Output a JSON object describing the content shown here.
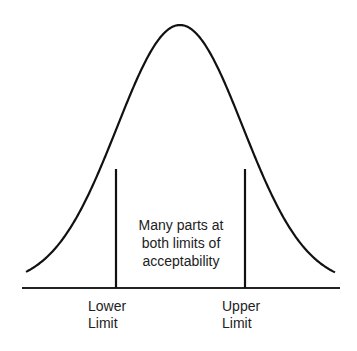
{
  "diagram": {
    "curve": {
      "type": "bell-curve",
      "peak_x": 180,
      "peak_y": 25,
      "baseline_y": 288,
      "color": "#111111"
    },
    "limits": [
      {
        "name": "Lower Limit",
        "x": 116
      },
      {
        "name": "Upper Limit",
        "x": 245
      }
    ],
    "annotation": {
      "lines": [
        "Many parts at",
        "both limits of",
        "acceptability"
      ]
    },
    "labels": {
      "lower": [
        "Lower",
        "Limit"
      ],
      "upper": [
        "Upper",
        "Limit"
      ]
    }
  }
}
